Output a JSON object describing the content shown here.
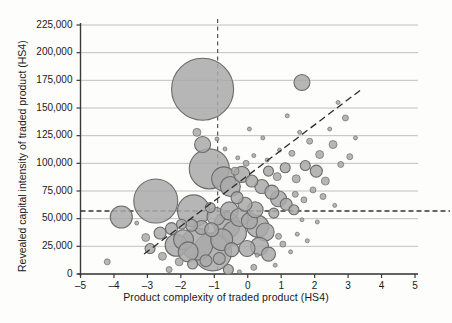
{
  "chart_data": {
    "type": "scatter",
    "title": "",
    "xlabel": "Product complexity of traded product (HS4)",
    "ylabel": "Revealed capital intensity of traded product (HS4)",
    "xlim": [
      -5,
      5
    ],
    "ylim": [
      0,
      225000
    ],
    "xticks": [
      -5,
      -4,
      -3,
      -2,
      -1,
      0,
      1,
      2,
      3,
      4,
      5
    ],
    "xtick_labels": [
      "–5",
      "–4",
      "–3",
      "–2",
      "–1",
      "0",
      "1",
      "2",
      "3",
      "4",
      "5"
    ],
    "yticks": [
      0,
      25000,
      50000,
      75000,
      100000,
      125000,
      150000,
      175000,
      200000,
      225000
    ],
    "ytick_labels": [
      "0",
      "25,000",
      "50,000",
      "75,000",
      "100,000",
      "125,000",
      "150,000",
      "175,000",
      "200,000",
      "225,000"
    ],
    "grid": "horizontal",
    "legend": "none",
    "marker_fill": "#a9a9a9",
    "marker_stroke": "#6b6b6b",
    "bubble_size_units": "relative trade value (bubble area)",
    "reference_lines": [
      {
        "name": "mean-complexity-vline",
        "orientation": "vertical",
        "x": -0.9,
        "style": "dashed",
        "color": "#555555"
      },
      {
        "name": "mean-capital-intensity-hline",
        "orientation": "horizontal",
        "y": 57000,
        "style": "dashed",
        "color": "#333333"
      }
    ],
    "trend_line": {
      "name": "fitted-regression-line",
      "style": "dashed",
      "color": "#2b2b2b",
      "x_start": -3.1,
      "y_start": 18000,
      "x_end": 3.45,
      "y_end": 168000
    },
    "points": [
      {
        "x": -1.35,
        "y": 167000,
        "r": 31
      },
      {
        "x": -2.75,
        "y": 66000,
        "r": 22
      },
      {
        "x": -1.15,
        "y": 95000,
        "r": 20
      },
      {
        "x": -1.62,
        "y": 57000,
        "r": 16
      },
      {
        "x": -3.78,
        "y": 51500,
        "r": 11
      },
      {
        "x": -1.35,
        "y": 117000,
        "r": 8
      },
      {
        "x": -1.52,
        "y": 128000,
        "r": 4
      },
      {
        "x": 1.62,
        "y": 173000,
        "r": 8
      },
      {
        "x": -1.05,
        "y": 20000,
        "r": 19
      },
      {
        "x": -1.52,
        "y": 27000,
        "r": 16
      },
      {
        "x": -0.62,
        "y": 44000,
        "r": 13
      },
      {
        "x": -0.4,
        "y": 37000,
        "r": 12
      },
      {
        "x": -0.78,
        "y": 31000,
        "r": 11
      },
      {
        "x": -1.92,
        "y": 31000,
        "r": 10
      },
      {
        "x": -2.14,
        "y": 26000,
        "r": 11
      },
      {
        "x": -1.78,
        "y": 20000,
        "r": 10
      },
      {
        "x": -0.95,
        "y": 52000,
        "r": 9
      },
      {
        "x": -0.55,
        "y": 57000,
        "r": 9
      },
      {
        "x": -0.25,
        "y": 51000,
        "r": 9
      },
      {
        "x": 0.05,
        "y": 48000,
        "r": 8
      },
      {
        "x": 0.3,
        "y": 43000,
        "r": 11
      },
      {
        "x": 0.52,
        "y": 38000,
        "r": 9
      },
      {
        "x": 0.22,
        "y": 58000,
        "r": 8
      },
      {
        "x": -0.08,
        "y": 63000,
        "r": 7
      },
      {
        "x": -0.32,
        "y": 69000,
        "r": 6
      },
      {
        "x": -0.52,
        "y": 79000,
        "r": 10
      },
      {
        "x": -0.72,
        "y": 86000,
        "r": 12
      },
      {
        "x": -0.18,
        "y": 90000,
        "r": 8
      },
      {
        "x": 0.12,
        "y": 84000,
        "r": 6
      },
      {
        "x": 0.42,
        "y": 79000,
        "r": 7
      },
      {
        "x": 0.72,
        "y": 74000,
        "r": 7
      },
      {
        "x": 0.92,
        "y": 68000,
        "r": 8
      },
      {
        "x": 1.15,
        "y": 63000,
        "r": 6
      },
      {
        "x": 1.38,
        "y": 58000,
        "r": 5
      },
      {
        "x": 0.62,
        "y": 93000,
        "r": 5
      },
      {
        "x": 0.88,
        "y": 88000,
        "r": 4
      },
      {
        "x": 1.12,
        "y": 96000,
        "r": 5
      },
      {
        "x": 1.45,
        "y": 86000,
        "r": 4
      },
      {
        "x": 1.72,
        "y": 98000,
        "r": 5
      },
      {
        "x": 2.05,
        "y": 93000,
        "r": 6
      },
      {
        "x": 2.32,
        "y": 84000,
        "r": 4
      },
      {
        "x": 2.15,
        "y": 108000,
        "r": 4
      },
      {
        "x": 2.55,
        "y": 117000,
        "r": 4
      },
      {
        "x": 1.85,
        "y": 120000,
        "r": 3
      },
      {
        "x": 2.78,
        "y": 99000,
        "r": 3
      },
      {
        "x": 3.05,
        "y": 106000,
        "r": 3
      },
      {
        "x": 1.32,
        "y": 109000,
        "r": 3
      },
      {
        "x": 0.95,
        "y": 112000,
        "r": 2
      },
      {
        "x": 1.55,
        "y": 128000,
        "r": 2
      },
      {
        "x": 2.45,
        "y": 131000,
        "r": 2
      },
      {
        "x": 2.92,
        "y": 141000,
        "r": 3
      },
      {
        "x": 0.58,
        "y": 103000,
        "r": 2
      },
      {
        "x": 0.18,
        "y": 107000,
        "r": 2
      },
      {
        "x": -0.05,
        "y": 100000,
        "r": 3
      },
      {
        "x": -0.3,
        "y": 105000,
        "r": 2
      },
      {
        "x": 1.95,
        "y": 76000,
        "r": 3
      },
      {
        "x": 2.25,
        "y": 70000,
        "r": 3
      },
      {
        "x": 1.68,
        "y": 67000,
        "r": 3
      },
      {
        "x": 1.42,
        "y": 72000,
        "r": 3
      },
      {
        "x": 2.6,
        "y": 62000,
        "r": 2
      },
      {
        "x": 0.35,
        "y": 25000,
        "r": 9
      },
      {
        "x": -0.02,
        "y": 23000,
        "r": 8
      },
      {
        "x": -0.48,
        "y": 22000,
        "r": 7
      },
      {
        "x": -0.85,
        "y": 14000,
        "r": 6
      },
      {
        "x": -1.25,
        "y": 12000,
        "r": 6
      },
      {
        "x": -1.65,
        "y": 9000,
        "r": 5
      },
      {
        "x": -0.58,
        "y": 4000,
        "r": 5
      },
      {
        "x": -2.35,
        "y": 4000,
        "r": 3
      },
      {
        "x": -2.05,
        "y": 11000,
        "r": 4
      },
      {
        "x": -2.55,
        "y": 16000,
        "r": 4
      },
      {
        "x": -2.92,
        "y": 23000,
        "r": 5
      },
      {
        "x": -4.2,
        "y": 11000,
        "r": 3
      },
      {
        "x": -3.05,
        "y": 33000,
        "r": 4
      },
      {
        "x": -2.62,
        "y": 37000,
        "r": 6
      },
      {
        "x": -2.28,
        "y": 41000,
        "r": 6
      },
      {
        "x": -1.98,
        "y": 45000,
        "r": 5
      },
      {
        "x": -1.68,
        "y": 44000,
        "r": 6
      },
      {
        "x": -1.38,
        "y": 42000,
        "r": 7
      },
      {
        "x": -1.08,
        "y": 40000,
        "r": 7
      },
      {
        "x": 0.62,
        "y": 18000,
        "r": 7
      },
      {
        "x": 0.18,
        "y": 6000,
        "r": 3
      },
      {
        "x": 0.82,
        "y": 8000,
        "r": 2
      },
      {
        "x": -0.25,
        "y": 2000,
        "r": 2
      },
      {
        "x": 1.05,
        "y": 27000,
        "r": 3
      },
      {
        "x": 1.28,
        "y": 20000,
        "r": 2
      },
      {
        "x": 0.92,
        "y": 34000,
        "r": 3
      },
      {
        "x": 1.48,
        "y": 36000,
        "r": 2
      },
      {
        "x": 1.78,
        "y": 30000,
        "r": 2
      },
      {
        "x": 2.08,
        "y": 47000,
        "r": 2
      },
      {
        "x": 1.62,
        "y": 49000,
        "r": 2
      },
      {
        "x": -3.32,
        "y": 46000,
        "r": 2
      },
      {
        "x": -0.68,
        "y": 113000,
        "r": 2
      },
      {
        "x": -0.92,
        "y": 122000,
        "r": 2
      },
      {
        "x": 0.45,
        "y": 123000,
        "r": 2
      },
      {
        "x": 0.05,
        "y": 131000,
        "r": 2
      },
      {
        "x": 3.22,
        "y": 123000,
        "r": 2
      },
      {
        "x": 2.7,
        "y": 155000,
        "r": 2
      },
      {
        "x": 1.18,
        "y": 143000,
        "r": 2
      },
      {
        "x": 0.28,
        "y": 17000,
        "r": 2
      },
      {
        "x": -1.12,
        "y": 60000,
        "r": 5
      },
      {
        "x": -0.38,
        "y": 93000,
        "r": 4
      },
      {
        "x": 0.78,
        "y": 55000,
        "r": 5
      }
    ]
  },
  "axes": {
    "x_title": "Product complexity of traded product (HS4)",
    "y_title": "Revealed capital intensity of traded product (HS4)"
  }
}
